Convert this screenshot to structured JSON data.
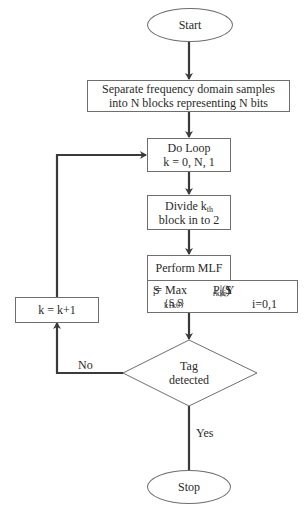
{
  "flowchart": {
    "start": {
      "label": "Start"
    },
    "separate": {
      "line1": "Separate frequency domain samples",
      "line2": "into N blocks representing N bits"
    },
    "do_loop": {
      "line1": "Do Loop",
      "line2": "k = 0, N, 1"
    },
    "divide": {
      "line1_prefix": "Divide k",
      "line1_sub": "th",
      "line2": "block in to 2"
    },
    "mlf": {
      "header": "Perform MLF",
      "eq_lhs": "S",
      "eq_lhs_sub": "i",
      "eq_max": " = Max",
      "eq_set": "{S",
      "eq_set_sub1": "k1",
      "eq_set_mid": " , S",
      "eq_set_sub2": "k0",
      "eq_set_end": "}",
      "eq_p": "P",
      "eq_p_sub": "r",
      "eq_paren_open": "  (Y",
      "eq_y_sub": "k",
      "eq_bar": "| S",
      "eq_s_sub": "ki",
      "eq_paren_close": ")",
      "eq_index": "i=0,1"
    },
    "decision": {
      "line1": "Tag",
      "line2": "detected"
    },
    "increment": {
      "label": "k = k+1"
    },
    "stop": {
      "label": "Stop"
    },
    "edge_labels": {
      "no": "No",
      "yes": "Yes"
    }
  },
  "colors": {
    "line": "#3a3a3a",
    "border": "#6e6e6e",
    "text": "#2a2a2a"
  }
}
